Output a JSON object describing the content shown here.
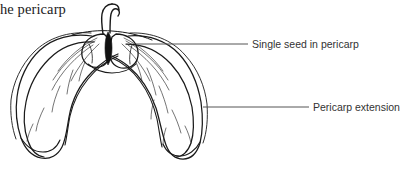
{
  "figure": {
    "type": "botanical-line-drawing",
    "background_color": "#ffffff",
    "ink_color": "#1a1a1a",
    "leader_line_color": "#555555"
  },
  "caption": {
    "fragment_text": "he pericarp"
  },
  "annotations": [
    {
      "id": "single-seed",
      "label": "Single seed in pericarp",
      "leader": {
        "x1": 136,
        "y1": 44,
        "x2": 248,
        "y2": 44
      }
    },
    {
      "id": "pericarp-extension",
      "label": "Pericarp extension",
      "leader": {
        "x1": 203,
        "y1": 107,
        "x2": 309,
        "y2": 107
      }
    }
  ],
  "drawing_parts": {
    "stalk": "stalk",
    "seed_left_lobe": "seed-left-lobe",
    "seed_right_lobe": "seed-right-lobe",
    "seed_notch": "seed-notch",
    "left_wing": "left-pericarp-wing",
    "right_wing": "right-pericarp-wing",
    "veins": "wing-veins"
  }
}
